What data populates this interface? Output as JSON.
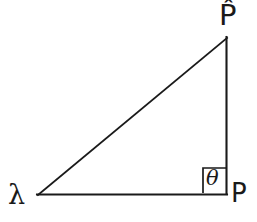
{
  "figure": {
    "type": "right-triangle-diagram",
    "background_color": "#ffffff",
    "stroke_color": "#1a1a1a",
    "stroke_width": 2
  },
  "labels": {
    "left_vertex": "λ",
    "top_vertex": "P̂",
    "bottom_right_vertex": "P",
    "angle": "θ"
  },
  "geometry": {
    "vertices": {
      "left": {
        "x": 37,
        "y": 196
      },
      "top_right": {
        "x": 227,
        "y": 38
      },
      "bottom_right": {
        "x": 227,
        "y": 194
      }
    },
    "right_angle_marker": {
      "x": 203,
      "y": 168,
      "width": 24,
      "height": 25
    }
  }
}
